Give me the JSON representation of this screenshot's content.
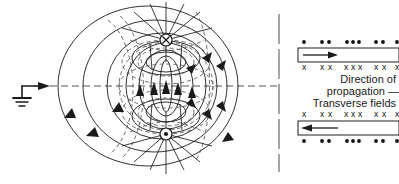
{
  "figure": {
    "background_color": "#ffffff",
    "line_color": "#1a1a1a",
    "dashed_color": "#555555"
  },
  "left_panel": {
    "name": "dipole-radiation-diagram",
    "ground_symbol": "earth-ground",
    "feed_arrow": "rightward-feed-arrow",
    "top_node_symbol": "x",
    "bottom_node_symbol": "•",
    "axis_style": "dash-dot-horizontal",
    "solid_loops_label": "electric field lines",
    "dashed_loops_label": "magnetic field lines"
  },
  "divider": {
    "name": "panel-divider",
    "style": "dashed-vertical"
  },
  "right_panel": {
    "name": "transverse-field-panel",
    "labels": [
      "Direction of",
      "propagation —",
      "Transverse fields"
    ],
    "top_box": {
      "arrow_direction": "right",
      "marks_above": "dots",
      "marks_below": "crosses"
    },
    "bottom_box": {
      "arrow_direction": "left",
      "marks_above": "crosses",
      "marks_below": "dots"
    },
    "dot_glyph": "•",
    "cross_glyph": "x",
    "dot_groups": [
      1,
      2,
      3,
      2,
      1
    ],
    "cross_groups": [
      1,
      2,
      3,
      2,
      1
    ]
  }
}
